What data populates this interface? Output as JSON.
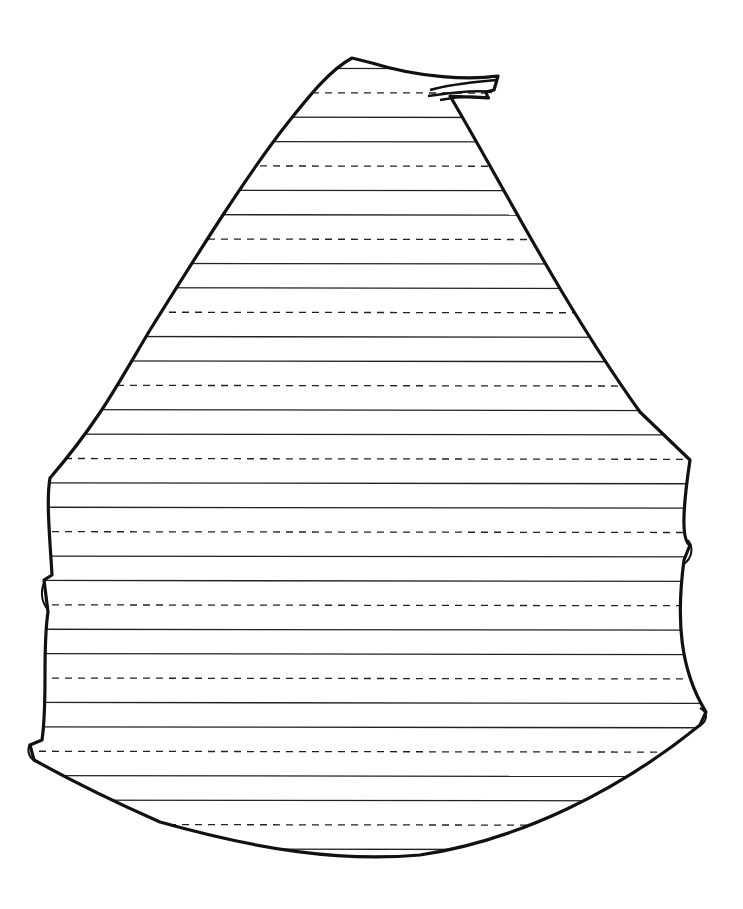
{
  "drawing": {
    "subject": "lined writing-practice sheet shaped like a sail",
    "line_pattern": [
      "solid",
      "solid",
      "dashed"
    ],
    "line_spacing_px": 24.4,
    "first_line_y": 68,
    "line_count": 33,
    "colors": {
      "ink": "#111111",
      "paper": "#ffffff"
    }
  }
}
